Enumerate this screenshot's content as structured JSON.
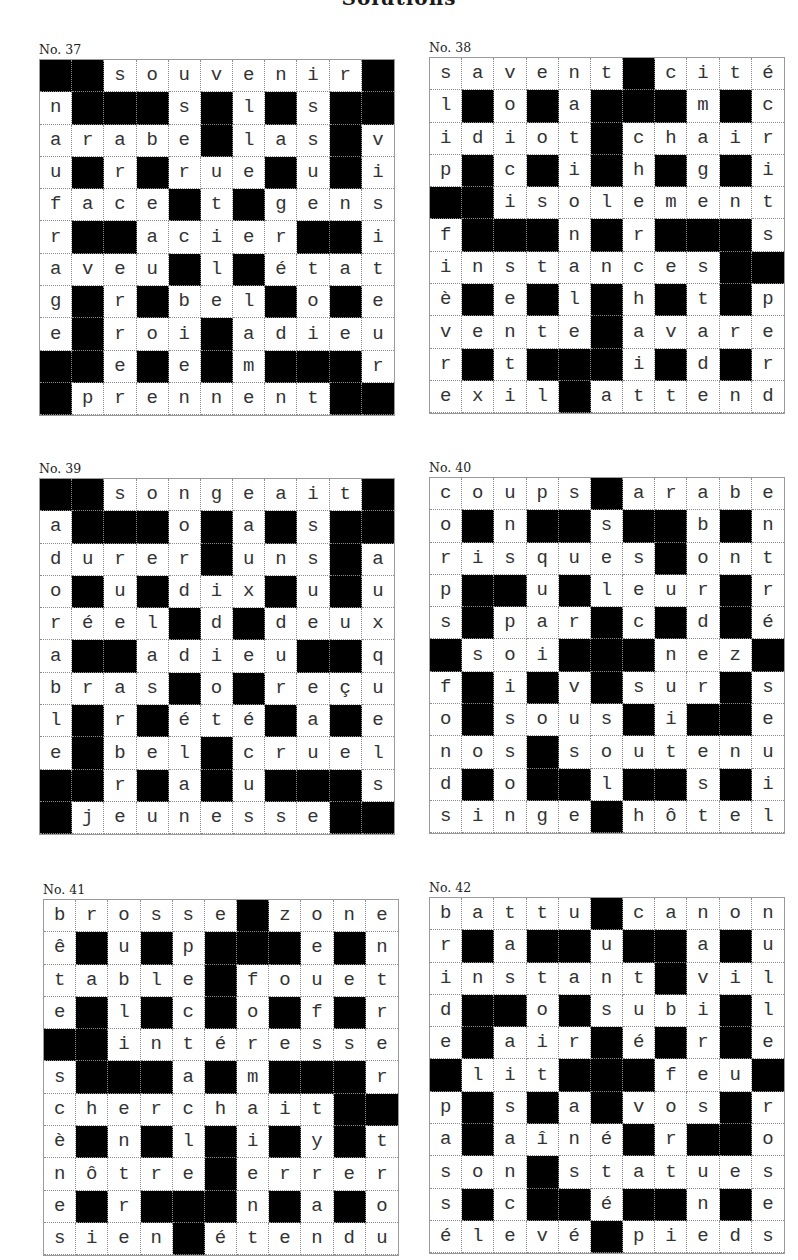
{
  "page": {
    "title": "Solutions"
  },
  "puzzles": [
    {
      "id": "p37",
      "label": "No. 37",
      "rows": [
        "##souvenir#",
        "n###s#l#s##",
        "arabe#las#v",
        "u#r#rue#u#i",
        "face#t#gens",
        "r##acier##i",
        "aveu#l#état",
        "g#r#bel#o#e",
        "e#roi#adieu",
        "##e#e#m###r",
        "#prennent##"
      ]
    },
    {
      "id": "p38",
      "label": "No. 38",
      "rows": [
        "savent#cité",
        "l#o#a###m#c",
        "idiot#chair",
        "p#c#i#h#g#i",
        "##isolement",
        "f###n#r###s",
        "instances##",
        "è#e#l#h#t#p",
        "vente#avare",
        "r#t###i#d#r",
        "exil#attend"
      ]
    },
    {
      "id": "p39",
      "label": "No. 39",
      "rows": [
        "##songeait#",
        "a###o#a#s##",
        "durer#uns#a",
        "o#u#dix#u#u",
        "réel#d#deux",
        "a##adieu##q",
        "bras#o#reçu",
        "l#r#été#a#e",
        "e#bel#cruel",
        "##r#a#u###s",
        "#jeunesse##"
      ]
    },
    {
      "id": "p40",
      "label": "No. 40",
      "rows": [
        "coups#arabe",
        "o#n##s##b#n",
        "risques#ont",
        "p##u#leur#r",
        "s#par#c#d#é",
        "#soi###nez#",
        "f#i#v#sur#s",
        "o#sous#i##e",
        "nos#soutenu",
        "d#o##l##s#i",
        "singe#hôtel"
      ]
    },
    {
      "id": "p41",
      "label": "No. 41",
      "rows": [
        "brosse#zone",
        "ê#u#p###e#n",
        "table#fouet",
        "e#l#c#o#f#r",
        "##intéresse",
        "s###a#m###r",
        "cherchait##",
        "è#n#l#i#y#t",
        "nôtre#errer",
        "e#r###n#a#o",
        "sien#étendu"
      ]
    },
    {
      "id": "p42",
      "label": "No. 42",
      "rows": [
        "battu#canon",
        "r#a##u##a#u",
        "instant#vil",
        "d##o#subi#l",
        "e#air#é#r#e",
        "#lit###feu#",
        "p#s#a#vos#r",
        "a#aîné#r##o",
        "son#statues",
        "s#c##é##n#e",
        "élevé#pieds"
      ]
    }
  ],
  "colors": {
    "block": "#000000",
    "cell": "#ffffff",
    "text": "#333333",
    "gridline": "#8c8c8c"
  }
}
